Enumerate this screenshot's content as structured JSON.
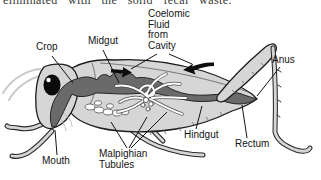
{
  "figure": {
    "caption_fragment": "eliminated with the solid fecal waste.",
    "labels": {
      "crop": "Crop",
      "midgut": "Midgut",
      "coelomic": [
        "Coelomic",
        "Fluid",
        "from",
        "Cavity"
      ],
      "anus": "Anus",
      "hindgut": "Hindgut",
      "rectum": "Rectum",
      "malpighian": [
        "Malpighian",
        "Tubules"
      ],
      "mouth": "Mouth"
    },
    "colors": {
      "background": "#ffffff",
      "body_gray": "#d6d6d6",
      "tract_gray": "#6a6a6a",
      "outline_black": "#1c1c1c",
      "text_black": "#141414"
    }
  }
}
